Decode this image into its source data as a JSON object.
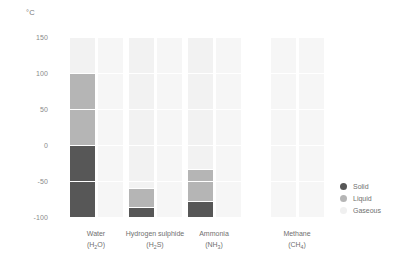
{
  "chart_data": {
    "type": "bar",
    "title": "",
    "subtitle": "",
    "xlabel": "",
    "ylabel": "°C",
    "unit_label": "°C",
    "ylim": [
      -100,
      150
    ],
    "yticks": [
      150,
      100,
      50,
      0,
      -50,
      -100
    ],
    "ytick_labels": [
      "150",
      "100",
      "50",
      "0",
      "-50",
      "-100"
    ],
    "grid": false,
    "legend_position": "right",
    "orientation": "vertical",
    "categories": [
      "Water",
      "Hydrogen sulphide",
      "Ammonia",
      "Methane"
    ],
    "category_formulas": [
      "(H2O)",
      "(H2S)",
      "(NH3)",
      "(CH4)"
    ],
    "legend": [
      {
        "name": "Solid",
        "color": "#575757"
      },
      {
        "name": "Liquid",
        "color": "#b5b5b5"
      },
      {
        "name": "Gaseous",
        "color": "#f2f2f2"
      }
    ],
    "series": [
      {
        "name": "Water",
        "formula_base": "(H",
        "formula_sub": "2",
        "formula_tail": "O)",
        "melting_point": 0,
        "boiling_point": 100,
        "segments": [
          {
            "phase": "Gaseous",
            "from": 100,
            "to": 150
          },
          {
            "phase": "Liquid",
            "from": 0,
            "to": 100
          },
          {
            "phase": "Solid",
            "from": -100,
            "to": 0
          }
        ]
      },
      {
        "name": "Hydrogen sulphide",
        "formula_base": "(H",
        "formula_sub": "2",
        "formula_tail": "S)",
        "melting_point": -86,
        "boiling_point": -60,
        "segments": [
          {
            "phase": "Gaseous",
            "from": -60,
            "to": 150
          },
          {
            "phase": "Liquid",
            "from": -86,
            "to": -60
          },
          {
            "phase": "Solid",
            "from": -100,
            "to": -86
          }
        ]
      },
      {
        "name": "Ammonia",
        "formula_base": "(NH",
        "formula_sub": "3",
        "formula_tail": ")",
        "melting_point": -78,
        "boiling_point": -33,
        "segments": [
          {
            "phase": "Gaseous",
            "from": -33,
            "to": 150
          },
          {
            "phase": "Liquid",
            "from": -78,
            "to": -33
          },
          {
            "phase": "Solid",
            "from": -100,
            "to": -78
          }
        ]
      },
      {
        "name": "Methane",
        "formula_base": "(CH",
        "formula_sub": "4",
        "formula_tail": ")",
        "melting_point": -182,
        "boiling_point": -161,
        "segments": [
          {
            "phase": "Gaseous",
            "from": -100,
            "to": 150
          }
        ]
      }
    ],
    "colors": {
      "solid": "#575757",
      "liquid": "#b5b5b5",
      "gaseous": "#f2f2f2",
      "ghost": "#f6f6f6",
      "text": "#6f6f6f",
      "tick": "#8a8a8a"
    }
  }
}
